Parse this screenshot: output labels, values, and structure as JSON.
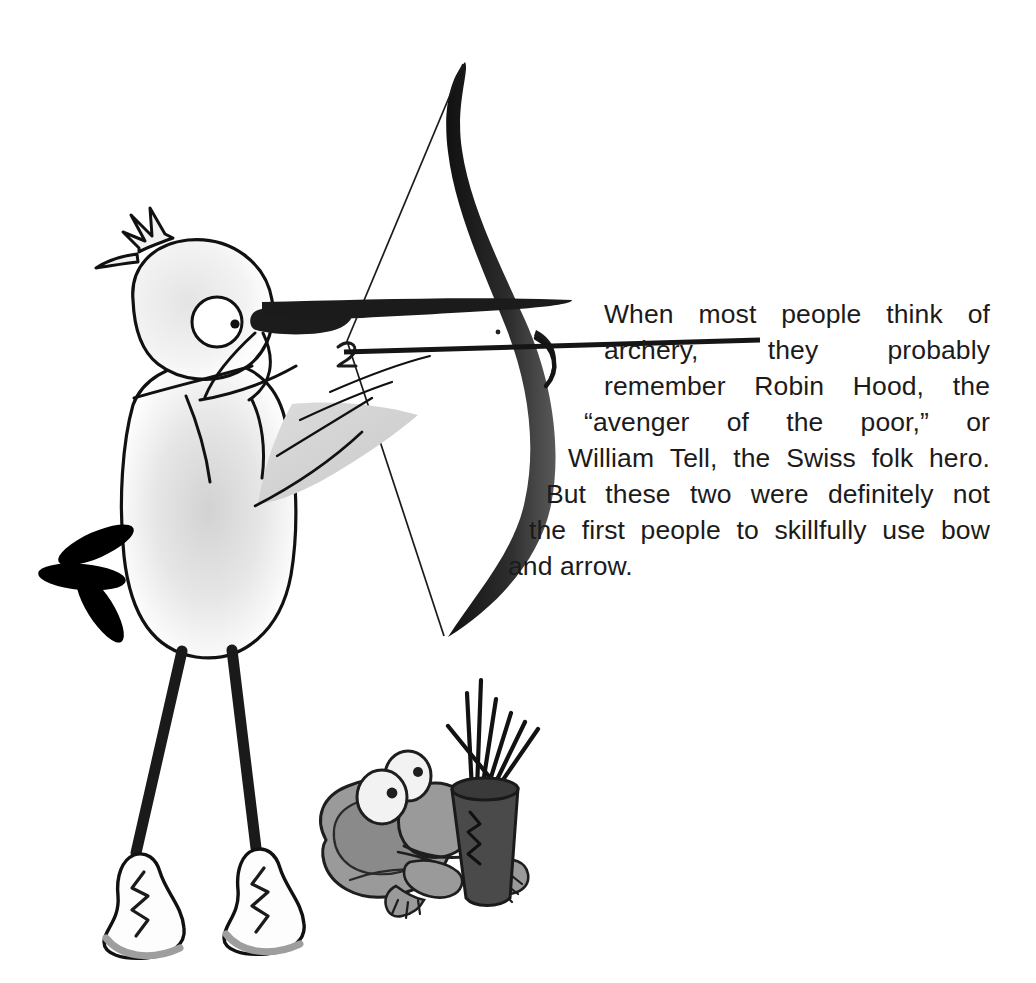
{
  "page": {
    "background_color": "#ffffff",
    "width": 1036,
    "height": 983
  },
  "paragraph": {
    "full_text": "When most people think of archery, they probably remember Robin Hood, the “avenger of the poor,” or William Tell, the Swiss folk hero. But these two were definitely not the first people to skillfully use bow and arrow.",
    "text_color": "#1b1b1b",
    "alignment": "justified",
    "lines": [
      {
        "id": "line-1",
        "words": [
          "When",
          "most",
          "people",
          "think",
          "of"
        ],
        "justified": true
      },
      {
        "id": "line-2",
        "words": [
          "archery,",
          "they",
          "probably"
        ],
        "justified": true
      },
      {
        "id": "line-3",
        "words": [
          "remember",
          "Robin",
          "Hood,",
          "the"
        ],
        "justified": true
      },
      {
        "id": "line-4",
        "words": [
          "“avenger",
          "of",
          "the",
          "poor,”",
          "or"
        ],
        "justified": true
      },
      {
        "id": "line-5",
        "words": [
          "William",
          "Tell,",
          "the",
          "Swiss",
          "folk",
          "hero."
        ],
        "justified": true
      },
      {
        "id": "line-6",
        "words": [
          "But",
          "these",
          "two",
          "were",
          "definitely",
          "not"
        ],
        "justified": true
      },
      {
        "id": "line-7",
        "words": [
          "the",
          "first",
          "people",
          "to",
          "skillfully",
          "use",
          "bow"
        ],
        "justified": true
      },
      {
        "id": "line-8",
        "words": [
          "and",
          "arrow."
        ],
        "justified": false
      }
    ]
  },
  "illustration": {
    "title": "Cartoon bird archer with frog quiver bearer",
    "colors": {
      "outline": "#111111",
      "bow_dark": "#1a1a1a",
      "bow_shade": "#4d4d4d",
      "bird_body": "#ffffff",
      "bird_shade": "#d9d9d9",
      "bird_shade_soft": "#e8e8e8",
      "tail_black": "#000000",
      "frog_body": "#9a9a9a",
      "frog_shade": "#8a8a8a",
      "frog_eye_white": "#f2f2f2",
      "quiver_dark": "#4a4a4a",
      "shoe_white": "#fdfdfd",
      "shoe_shade": "#9e9e9e"
    },
    "parts": [
      {
        "name": "bow",
        "label": "Recurve bow"
      },
      {
        "name": "bowstring",
        "label": "Bow string"
      },
      {
        "name": "arrow",
        "label": "Nocked arrow"
      },
      {
        "name": "bird",
        "label": "Bird archer"
      },
      {
        "name": "bird-crest",
        "label": "Head crest feathers"
      },
      {
        "name": "bird-eye",
        "label": "Bird eye"
      },
      {
        "name": "bird-beak",
        "label": "Bird beak"
      },
      {
        "name": "bird-wing",
        "label": "Bird wing"
      },
      {
        "name": "bird-tail",
        "label": "Tail feathers"
      },
      {
        "name": "bird-legs",
        "label": "Bird legs"
      },
      {
        "name": "bird-shoes",
        "label": "Sneakers"
      },
      {
        "name": "frog",
        "label": "Frog helper"
      },
      {
        "name": "frog-eyes",
        "label": "Frog eyes"
      },
      {
        "name": "quiver",
        "label": "Quiver of arrows"
      }
    ]
  }
}
